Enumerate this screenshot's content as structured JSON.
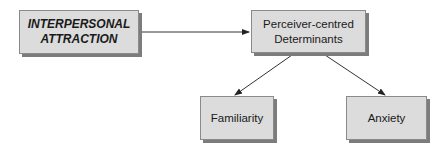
{
  "diagram": {
    "nodes": [
      {
        "id": "attraction",
        "label_line1": "INTERPERSONAL",
        "label_line2": "ATTRACTION"
      },
      {
        "id": "determinants",
        "label_line1": "Perceiver-centred",
        "label_line2": "Determinants"
      },
      {
        "id": "familiarity",
        "label": "Familiarity"
      },
      {
        "id": "anxiety",
        "label": "Anxiety"
      }
    ],
    "edges": [
      {
        "from": "attraction",
        "to": "determinants"
      },
      {
        "from": "determinants",
        "to": "familiarity"
      },
      {
        "from": "determinants",
        "to": "anxiety"
      }
    ]
  }
}
